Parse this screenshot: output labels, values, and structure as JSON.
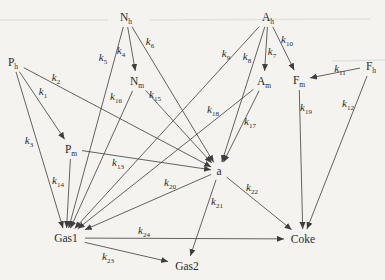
{
  "figure": {
    "width": 385,
    "height": 280,
    "background_color": "#f4f3ef",
    "line_color": "#3e3e3e",
    "text_color": "#2b2b2b",
    "nodes": [
      {
        "id": "Ph",
        "text": "P",
        "sub": "h",
        "x": 13,
        "y": 62
      },
      {
        "id": "Nh",
        "text": "N",
        "sub": "h",
        "x": 126,
        "y": 17
      },
      {
        "id": "Ah",
        "text": "A",
        "sub": "h",
        "x": 268,
        "y": 17
      },
      {
        "id": "Fh",
        "text": "F",
        "sub": "h",
        "x": 371,
        "y": 66
      },
      {
        "id": "Nm",
        "text": "N",
        "sub": "m",
        "x": 137,
        "y": 81
      },
      {
        "id": "Am",
        "text": "A",
        "sub": "m",
        "x": 264,
        "y": 81
      },
      {
        "id": "Fm",
        "text": "F",
        "sub": "m",
        "x": 299,
        "y": 80
      },
      {
        "id": "Pm",
        "text": "P",
        "sub": "m",
        "x": 71,
        "y": 149
      },
      {
        "id": "a",
        "text": "a",
        "sub": "",
        "x": 219,
        "y": 171
      },
      {
        "id": "Gas1",
        "text": "Gas1",
        "sub": "",
        "x": 66,
        "y": 238
      },
      {
        "id": "Coke",
        "text": "Coke",
        "sub": "",
        "x": 303,
        "y": 239
      },
      {
        "id": "Gas2",
        "text": "Gas2",
        "sub": "",
        "x": 187,
        "y": 266
      }
    ],
    "edges": [
      {
        "from": "Ph",
        "to": "Pm",
        "label": "k",
        "sub": "1",
        "lx": 43,
        "ly": 92
      },
      {
        "from": "Ph",
        "to": "a",
        "label": "k",
        "sub": "2",
        "lx": 56,
        "ly": 78
      },
      {
        "from": "Ph",
        "to": "Gas1",
        "label": "k",
        "sub": "3",
        "lx": 29,
        "ly": 141
      },
      {
        "from": "Nh",
        "to": "Nm",
        "label": "k",
        "sub": "4",
        "lx": 121,
        "ly": 51
      },
      {
        "from": "Nh",
        "to": "Gas1",
        "label": "k",
        "sub": "5",
        "lx": 103,
        "ly": 58
      },
      {
        "from": "Nh",
        "to": "a",
        "label": "k",
        "sub": "6",
        "lx": 150,
        "ly": 42
      },
      {
        "from": "Ah",
        "to": "Am",
        "label": "k",
        "sub": "7",
        "lx": 272,
        "ly": 52
      },
      {
        "from": "Ah",
        "to": "a",
        "label": "k",
        "sub": "8",
        "lx": 247,
        "ly": 57
      },
      {
        "from": "Ah",
        "to": "Gas1",
        "label": "k",
        "sub": "9",
        "lx": 226,
        "ly": 54
      },
      {
        "from": "Ah",
        "to": "Fm",
        "label": "k",
        "sub": "10",
        "lx": 287,
        "ly": 40
      },
      {
        "from": "Fh",
        "to": "Fm",
        "label": "k",
        "sub": "11",
        "lx": 340,
        "ly": 69
      },
      {
        "from": "Fh",
        "to": "Coke",
        "label": "k",
        "sub": "12",
        "lx": 348,
        "ly": 104
      },
      {
        "from": "Pm",
        "to": "a",
        "label": "k",
        "sub": "13",
        "lx": 118,
        "ly": 163
      },
      {
        "from": "Pm",
        "to": "Gas1",
        "label": "k",
        "sub": "14",
        "lx": 58,
        "ly": 181
      },
      {
        "from": "Nm",
        "to": "a",
        "label": "k",
        "sub": "15",
        "lx": 155,
        "ly": 95
      },
      {
        "from": "Nm",
        "to": "Gas1",
        "label": "k",
        "sub": "16",
        "lx": 116,
        "ly": 97
      },
      {
        "from": "Am",
        "to": "a",
        "label": "k",
        "sub": "17",
        "lx": 250,
        "ly": 122
      },
      {
        "from": "Am",
        "to": "Gas1",
        "label": "k",
        "sub": "18",
        "lx": 213,
        "ly": 110
      },
      {
        "from": "Fm",
        "to": "Coke",
        "label": "k",
        "sub": "19",
        "lx": 306,
        "ly": 108
      },
      {
        "from": "a",
        "to": "Gas1",
        "label": "k",
        "sub": "20",
        "lx": 170,
        "ly": 183
      },
      {
        "from": "a",
        "to": "Gas2",
        "label": "k",
        "sub": "21",
        "lx": 217,
        "ly": 202
      },
      {
        "from": "a",
        "to": "Coke",
        "label": "k",
        "sub": "22",
        "lx": 252,
        "ly": 188
      },
      {
        "from": "Gas1",
        "to": "Gas2",
        "label": "k",
        "sub": "23",
        "lx": 108,
        "ly": 257
      },
      {
        "from": "Gas1",
        "to": "Coke",
        "label": "k",
        "sub": "24",
        "lx": 144,
        "ly": 231
      }
    ]
  }
}
